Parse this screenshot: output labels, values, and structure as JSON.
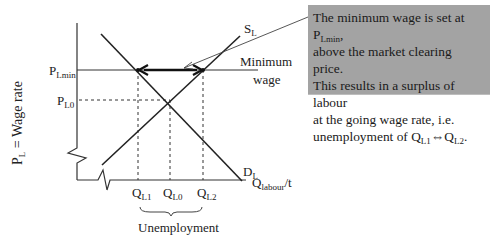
{
  "diagram": {
    "type": "labour-market-minimum-wage",
    "y_axis_label": {
      "main": "P",
      "sub": "L",
      "rest": " = Wage rate"
    },
    "x_axis_label": {
      "main": "Q",
      "sub": "labour",
      "rest": "/t"
    },
    "price_labels": {
      "pmin": {
        "main": "P",
        "sub": "Lmin"
      },
      "p0": {
        "main": "P",
        "sub": "L0"
      }
    },
    "quantity_labels": {
      "q1": {
        "main": "Q",
        "sub": "L1"
      },
      "q0": {
        "main": "Q",
        "sub": "L0"
      },
      "q2": {
        "main": "Q",
        "sub": "L2"
      }
    },
    "curves": {
      "supply": {
        "main": "S",
        "sub": "L"
      },
      "demand": {
        "main": "D",
        "sub": "L"
      }
    },
    "min_wage_label": {
      "line1": "Minimum",
      "line2": "wage"
    },
    "brace_label": "Unemployment",
    "callout": {
      "line1_pre": "The minimum wage is set at P",
      "line1_sub": "Lmin",
      "line1_post": ",",
      "line2": "above the market clearing price.",
      "line3": "This results in a surplus of labour",
      "line4": "at the going wage rate, i.e.",
      "line5_pre": "unemployment of Q",
      "line5_sub1": "L1",
      "line5_arrow": "⇔",
      "line5_mid": "Q",
      "line5_sub2": "L2",
      "line5_post": ".",
      "background": "#a3a3a3"
    },
    "colors": {
      "line": "#222222",
      "box": "#a3a3a3"
    }
  }
}
